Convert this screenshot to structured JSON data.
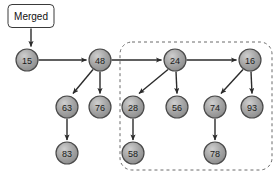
{
  "diagram": {
    "title_box": {
      "label": "Merged",
      "x": 31,
      "y": 16,
      "width": 46,
      "height": 23
    },
    "colors": {
      "node_fill": "#9d9d9d",
      "node_fill_light": "#c9c9c9",
      "node_stroke": "#4a4a4a",
      "edge": "#2b2b2b",
      "dashed_group": "#6b6b6b",
      "text": "#1a1a1a",
      "background": "#ffffff"
    },
    "node_radius": 11,
    "nodes": [
      {
        "id": "n15",
        "label": "15",
        "cx": 27,
        "cy": 60,
        "row": 1
      },
      {
        "id": "n48",
        "label": "48",
        "cx": 100,
        "cy": 60,
        "row": 1
      },
      {
        "id": "n24",
        "label": "24",
        "cx": 175,
        "cy": 60,
        "row": 1
      },
      {
        "id": "n16",
        "label": "16",
        "cx": 250,
        "cy": 60,
        "row": 1
      },
      {
        "id": "n63",
        "label": "63",
        "cx": 67,
        "cy": 107,
        "row": 2
      },
      {
        "id": "n76",
        "label": "76",
        "cx": 100,
        "cy": 107,
        "row": 2
      },
      {
        "id": "n28",
        "label": "28",
        "cx": 133,
        "cy": 107,
        "row": 2
      },
      {
        "id": "n56",
        "label": "56",
        "cx": 177,
        "cy": 107,
        "row": 2
      },
      {
        "id": "n74",
        "label": "74",
        "cx": 215,
        "cy": 107,
        "row": 2
      },
      {
        "id": "n93",
        "label": "93",
        "cx": 252,
        "cy": 107,
        "row": 2
      },
      {
        "id": "n83",
        "label": "83",
        "cx": 67,
        "cy": 153,
        "row": 3
      },
      {
        "id": "n58",
        "label": "58",
        "cx": 133,
        "cy": 153,
        "row": 3
      },
      {
        "id": "n78",
        "label": "78",
        "cx": 215,
        "cy": 153,
        "row": 3
      }
    ],
    "edges": [
      {
        "from": "n15",
        "to": "n48",
        "kind": "horizontal"
      },
      {
        "from": "n48",
        "to": "n24",
        "kind": "horizontal"
      },
      {
        "from": "n24",
        "to": "n16",
        "kind": "horizontal"
      },
      {
        "from": "n48",
        "to": "n63",
        "kind": "diagonal"
      },
      {
        "from": "n48",
        "to": "n76",
        "kind": "vertical"
      },
      {
        "from": "n24",
        "to": "n28",
        "kind": "diagonal"
      },
      {
        "from": "n24",
        "to": "n56",
        "kind": "vertical"
      },
      {
        "from": "n16",
        "to": "n74",
        "kind": "diagonal"
      },
      {
        "from": "n16",
        "to": "n93",
        "kind": "vertical"
      },
      {
        "from": "n63",
        "to": "n83",
        "kind": "vertical"
      },
      {
        "from": "n28",
        "to": "n58",
        "kind": "vertical"
      },
      {
        "from": "n74",
        "to": "n78",
        "kind": "vertical"
      }
    ],
    "merged_arrow": {
      "x": 31,
      "y1": 29,
      "y2": 47
    },
    "dashed_group": {
      "x": 120,
      "y": 42,
      "width": 152,
      "height": 128,
      "radius": 12
    }
  }
}
